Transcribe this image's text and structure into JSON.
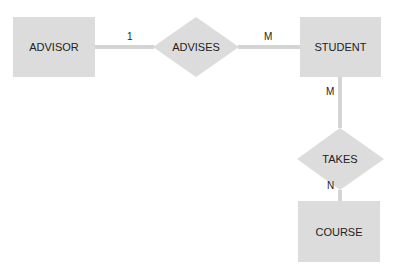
{
  "diagram": {
    "type": "er-diagram",
    "entities": [
      {
        "id": "advisor",
        "label": "ADVISOR"
      },
      {
        "id": "student",
        "label": "STUDENT"
      },
      {
        "id": "course",
        "label": "COURSE"
      }
    ],
    "relationships": [
      {
        "id": "advises",
        "label": "ADVISES",
        "from": "advisor",
        "to": "student",
        "from_cardinality": "1",
        "to_cardinality": "M"
      },
      {
        "id": "takes",
        "label": "TAKES",
        "from": "student",
        "to": "course",
        "from_cardinality": "M",
        "to_cardinality": "N"
      }
    ],
    "colors": {
      "shape_fill": "#dcdcdc",
      "line": "#d4d4d4",
      "text": "#222222"
    }
  }
}
